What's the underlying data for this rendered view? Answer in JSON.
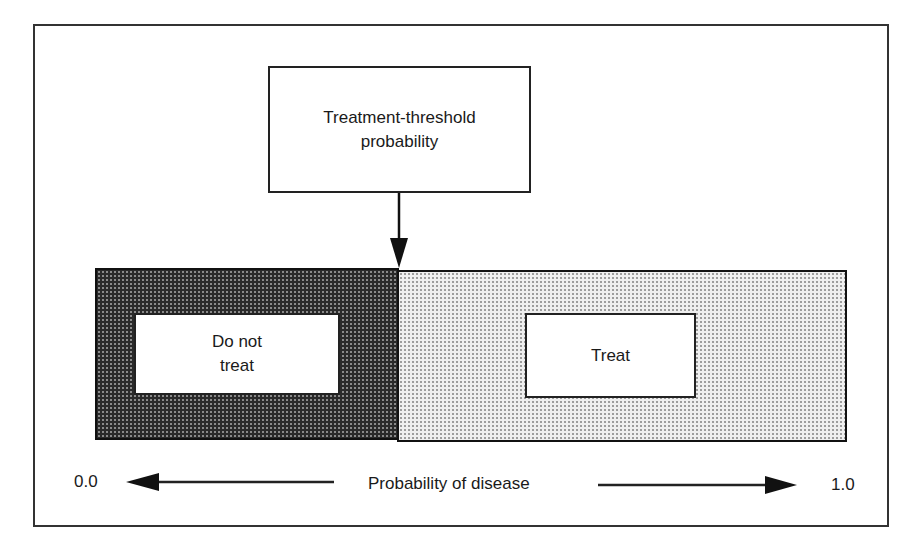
{
  "diagram": {
    "threshold_box": {
      "line1": "Treatment-threshold",
      "line2": "probability"
    },
    "regions": [
      {
        "name": "do-not-treat",
        "line1": "Do not",
        "line2": "treat",
        "fill": "#2a2a2a"
      },
      {
        "name": "treat",
        "label": "Treat",
        "fill": "#efefef"
      }
    ],
    "axis": {
      "min_label": "0.0",
      "max_label": "1.0",
      "title": "Probability of disease"
    },
    "colors": {
      "stroke": "#222222",
      "dark_fill": "#2a2a2a",
      "light_fill": "#efefef",
      "background": "#ffffff"
    }
  }
}
